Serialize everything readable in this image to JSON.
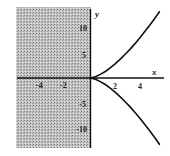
{
  "chart_data": {
    "type": "line",
    "title": "",
    "xlabel": "x",
    "ylabel": "y",
    "xlim": [
      -6,
      6
    ],
    "ylim": [
      -14,
      14
    ],
    "grid": false,
    "legend": null,
    "x_ticks": [
      {
        "value": -4,
        "label": "-4"
      },
      {
        "value": -2,
        "label": "-2"
      },
      {
        "value": 2,
        "label": "2"
      },
      {
        "value": 4,
        "label": "4"
      }
    ],
    "y_ticks": [
      {
        "value": 10,
        "label": "10"
      },
      {
        "value": 5,
        "label": "5"
      },
      {
        "value": -5,
        "label": "-5"
      },
      {
        "value": -10,
        "label": "-10"
      }
    ],
    "shaded_region": {
      "description": "x < 0 (excluded domain)",
      "x_range": [
        -6,
        0
      ],
      "pattern": "stippled gray"
    },
    "series": [
      {
        "name": "upper branch (y = x^(3/2))",
        "x": [
          0,
          0.4,
          0.8,
          1.2,
          1.6,
          2.0,
          2.4,
          2.8,
          3.2,
          3.6,
          4.0,
          4.4,
          4.8,
          5.2,
          5.6
        ],
        "y": [
          0,
          0.25,
          0.72,
          1.31,
          2.02,
          2.83,
          3.72,
          4.69,
          5.72,
          6.83,
          8.0,
          9.23,
          10.52,
          11.86,
          13.25
        ]
      },
      {
        "name": "lower branch (y = -x^(3/2))",
        "x": [
          0,
          0.4,
          0.8,
          1.2,
          1.6,
          2.0,
          2.4,
          2.8,
          3.2,
          3.6,
          4.0,
          4.4,
          4.8,
          5.2,
          5.6
        ],
        "y": [
          0,
          -0.25,
          -0.72,
          -1.31,
          -2.02,
          -2.83,
          -3.72,
          -4.69,
          -5.72,
          -6.83,
          -8.0,
          -9.23,
          -10.52,
          -11.86,
          -13.25
        ]
      }
    ],
    "colors": {
      "curve": "#111111",
      "axis": "#111111",
      "shade": "#b8b8b8",
      "shade_dot": "#8a8a8a"
    }
  }
}
